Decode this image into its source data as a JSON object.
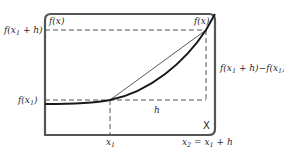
{
  "diagram": {
    "axis_labels": {
      "y_axis_top": "f(x)",
      "curve_end": "f(x)",
      "x_marker": "X"
    },
    "y_labels": {
      "upper": {
        "text": "f(x",
        "sub": "1",
        "rest": " + h)"
      },
      "lower": {
        "text": "f(x",
        "sub": "1",
        "rest": ")"
      }
    },
    "x_labels": {
      "x1": {
        "text": "x",
        "sub": "1"
      },
      "x2": {
        "pre": "x",
        "pre_sub": "2",
        "mid": " = x",
        "mid_sub": "1",
        "rest": " + h"
      }
    },
    "h_label": "h",
    "delta_label": {
      "a": "f(x",
      "a_sub": "1",
      "b": " + h)−f(x",
      "b_sub": "1",
      "c": ")"
    },
    "colors": {
      "frame": "#555555",
      "curve": "#1a1a1a",
      "secant": "#444444",
      "dashed": "#555555",
      "text": "#2a2a2a"
    }
  }
}
